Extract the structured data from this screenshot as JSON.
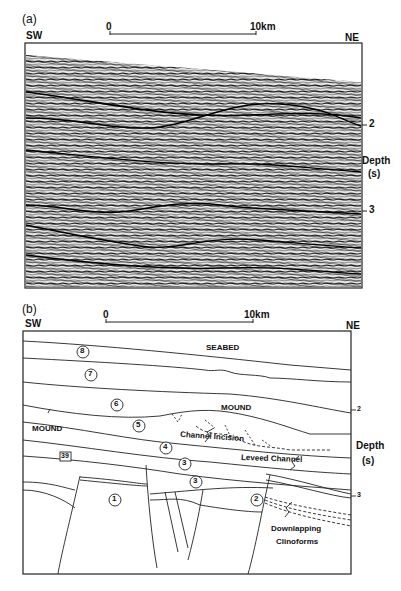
{
  "panel_a": {
    "label": "(a)",
    "left_dir": "SW",
    "right_dir": "NE",
    "scale": {
      "start": "0",
      "end": "10km"
    },
    "depth_axis": {
      "ticks": [
        "2",
        "3"
      ],
      "title": "Depth",
      "unit": "(s)"
    },
    "content": "seismic-reflection-profile"
  },
  "panel_b": {
    "label": "(b)",
    "left_dir": "SW",
    "right_dir": "NE",
    "scale": {
      "start": "0",
      "end": "10km"
    },
    "depth_axis": {
      "ticks": [
        "2",
        "3"
      ],
      "title": "Depth",
      "unit": "(s)"
    },
    "units": [
      "8",
      "7",
      "6",
      "5",
      "4",
      "3",
      "3",
      "2",
      "1"
    ],
    "well": "39",
    "annotations": {
      "seabed": "SEABED",
      "mound_center": "MOUND",
      "mound_left": "MOUND",
      "channel_incision": "Channel Incision",
      "leveed_channel": "Leveed Channel",
      "downlapping_1": "Downlapping",
      "downlapping_2": "Clinoforms"
    }
  }
}
